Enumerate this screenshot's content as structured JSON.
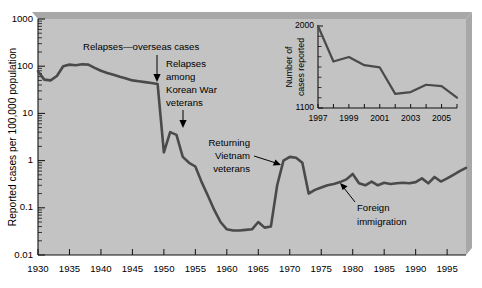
{
  "chart_data": {
    "type": "line",
    "title": "",
    "xlabel": "",
    "ylabel": "Reported cases per 100,000 population",
    "y_scale": "log",
    "ylim": [
      0.01,
      1000
    ],
    "xlim": [
      1930,
      1998
    ],
    "grid": false,
    "legend": "none",
    "y_tick_labels": [
      "0.01",
      "0.1",
      "1",
      "10",
      "100",
      "1000"
    ],
    "y_tick_values": [
      0.01,
      0.1,
      1,
      10,
      100,
      1000
    ],
    "x_tick_labels": [
      "1930",
      "1935",
      "1940",
      "1945",
      "1950",
      "1955",
      "1960",
      "1965",
      "1970",
      "1975",
      "1980",
      "1985",
      "1990",
      "1995"
    ],
    "x_tick_values": [
      1930,
      1935,
      1940,
      1945,
      1950,
      1955,
      1960,
      1965,
      1970,
      1975,
      1980,
      1985,
      1990,
      1995
    ],
    "series": [
      {
        "name": "Reported cases per 100,000 population",
        "color": "#4a4a4a",
        "x": [
          1930,
          1931,
          1932,
          1933,
          1934,
          1935,
          1936,
          1937,
          1938,
          1939,
          1940,
          1941,
          1942,
          1943,
          1944,
          1945,
          1946,
          1947,
          1948,
          1949,
          1950,
          1951,
          1952,
          1953,
          1954,
          1955,
          1956,
          1957,
          1958,
          1959,
          1960,
          1961,
          1962,
          1963,
          1964,
          1965,
          1966,
          1967,
          1968,
          1969,
          1970,
          1971,
          1972,
          1973,
          1974,
          1975,
          1976,
          1977,
          1978,
          1979,
          1980,
          1981,
          1982,
          1983,
          1984,
          1985,
          1986,
          1987,
          1988,
          1989,
          1990,
          1991,
          1992,
          1993,
          1994,
          1995,
          1996,
          1997,
          1998
        ],
        "y": [
          78,
          52,
          50,
          62,
          100,
          108,
          105,
          110,
          108,
          92,
          80,
          72,
          66,
          60,
          55,
          50,
          48,
          46,
          44,
          42,
          1.5,
          4.0,
          3.5,
          1.2,
          0.9,
          0.75,
          0.35,
          0.18,
          0.09,
          0.05,
          0.035,
          0.033,
          0.033,
          0.034,
          0.035,
          0.05,
          0.038,
          0.04,
          0.3,
          1.0,
          1.2,
          1.15,
          0.9,
          0.2,
          0.24,
          0.27,
          0.3,
          0.32,
          0.35,
          0.4,
          0.52,
          0.33,
          0.3,
          0.36,
          0.3,
          0.34,
          0.32,
          0.33,
          0.34,
          0.33,
          0.35,
          0.42,
          0.33,
          0.45,
          0.36,
          0.42,
          0.5,
          0.6,
          0.7
        ]
      }
    ],
    "annotations": [
      {
        "text": "Relapses—overseas cases",
        "pointer_x": 1945,
        "pointer_y": 42
      },
      {
        "text": "Relapses among Korean War veterans",
        "lines": [
          "Relapses",
          "among",
          "Korean War",
          "veterans"
        ],
        "pointer_x": 1951,
        "pointer_y": 4.0
      },
      {
        "text": "Returning Vietnam veterans",
        "lines": [
          "Returning",
          "Vietnam",
          "veterans"
        ],
        "pointer_x": 1968,
        "pointer_y": 1.0
      },
      {
        "text": "Foreign immigration",
        "lines": [
          "Foreign",
          "immigration"
        ],
        "pointer_x": 1979,
        "pointer_y": 0.4
      }
    ],
    "inset": {
      "type": "line",
      "ylabel": "Number of cases reported",
      "ylabel_lines": [
        "Number of",
        "cases reported"
      ],
      "ylim": [
        1100,
        2000
      ],
      "xlim": [
        1997,
        2006
      ],
      "y_tick_labels": [
        "1100",
        "2000"
      ],
      "y_tick_values": [
        1100,
        2000
      ],
      "x_tick_labels": [
        "1997",
        "1999",
        "2001",
        "2003",
        "2005"
      ],
      "x_tick_values": [
        1997,
        1999,
        2001,
        2003,
        2005
      ],
      "series": [
        {
          "name": "Number of cases reported",
          "color": "#4a4a4a",
          "x": [
            1997,
            1998,
            1999,
            2000,
            2001,
            2002,
            2003,
            2004,
            2005,
            2006
          ],
          "y": [
            2000,
            1610,
            1660,
            1570,
            1545,
            1255,
            1275,
            1355,
            1340,
            1215
          ]
        }
      ]
    }
  },
  "figure": {
    "plot_background_color": "#c3c3c3",
    "shadow_color": "#a8a8a8",
    "line_color": "#4a4a4a",
    "axis_color": "#111111",
    "text_color": "#000000",
    "page_background_color": "#ffffff"
  }
}
